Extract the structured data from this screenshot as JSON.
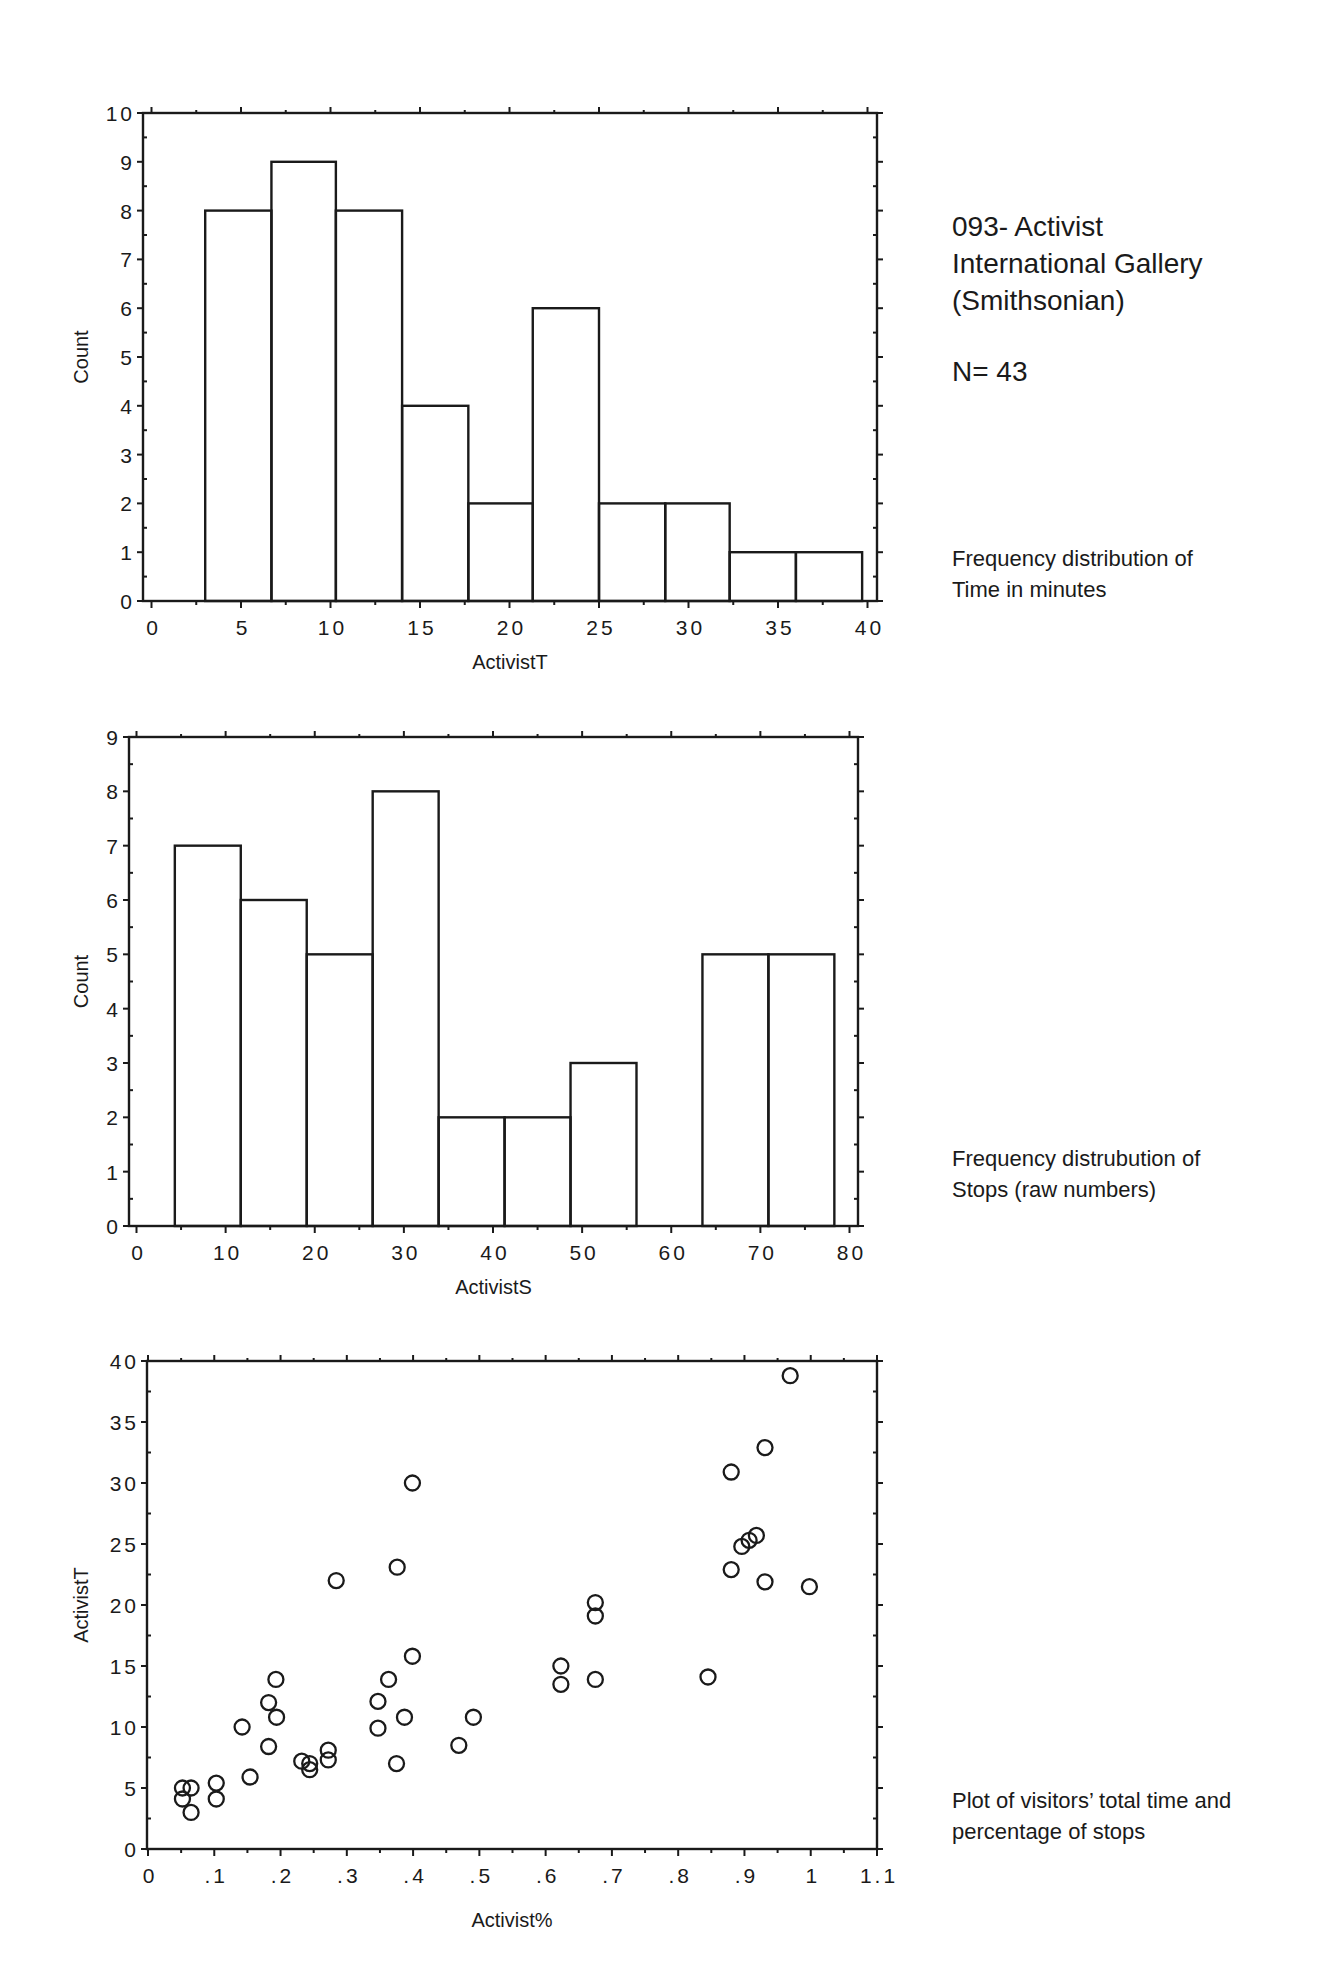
{
  "header": {
    "title_lines": [
      "093- Activist",
      "International Gallery",
      "(Smithsonian)"
    ],
    "n_label": "N= 43"
  },
  "captions": {
    "chart1": [
      "Frequency distribution of",
      "Time in minutes"
    ],
    "chart2": [
      "Frequency distrubution of",
      "Stops (raw numbers)"
    ],
    "chart3": [
      "Plot of visitors’ total time and",
      "percentage of stops"
    ]
  },
  "colors": {
    "ink": "#1a1a1a",
    "background": "#ffffff"
  },
  "chart_data": [
    {
      "type": "bar",
      "subtype": "histogram",
      "title": "Frequency distribution of Time in minutes",
      "xlabel": "ActivistT",
      "ylabel": "Count",
      "xlim": [
        0,
        40
      ],
      "ylim": [
        0,
        10
      ],
      "xticks": [
        0,
        5,
        10,
        15,
        20,
        25,
        30,
        35,
        40
      ],
      "xtick_labels": [
        "0",
        "5",
        "10",
        "15",
        "20",
        "25",
        "30",
        "35",
        "40"
      ],
      "yticks": [
        0,
        1,
        2,
        3,
        4,
        5,
        6,
        7,
        8,
        9,
        10
      ],
      "ytick_labels": [
        "0",
        "1",
        "2",
        "3",
        "4",
        "5",
        "6",
        "7",
        "8",
        "9",
        "10"
      ],
      "grid": false,
      "bin_edges": [
        3.0,
        6.7,
        10.3,
        14.0,
        17.7,
        21.3,
        25.0,
        28.7,
        32.3,
        36.0,
        39.7
      ],
      "values": [
        8,
        9,
        8,
        4,
        2,
        6,
        2,
        2,
        1,
        1
      ]
    },
    {
      "type": "bar",
      "subtype": "histogram",
      "title": "Frequency distrubution of Stops (raw numbers)",
      "xlabel": "ActivistS",
      "ylabel": "Count",
      "xlim": [
        0,
        80
      ],
      "ylim": [
        0,
        9
      ],
      "xticks": [
        0,
        10,
        20,
        30,
        40,
        50,
        60,
        70,
        80
      ],
      "xtick_labels": [
        "0",
        "10",
        "20",
        "30",
        "40",
        "50",
        "60",
        "70",
        "80"
      ],
      "yticks": [
        0,
        1,
        2,
        3,
        4,
        5,
        6,
        7,
        8,
        9
      ],
      "ytick_labels": [
        "0",
        "1",
        "2",
        "3",
        "4",
        "5",
        "6",
        "7",
        "8",
        "9"
      ],
      "grid": false,
      "bin_edges": [
        4.3,
        11.7,
        19.1,
        26.5,
        33.9,
        41.3,
        48.7,
        56.1,
        63.5,
        70.9,
        78.3
      ],
      "values": [
        7,
        6,
        5,
        8,
        2,
        2,
        3,
        0,
        5,
        5
      ]
    },
    {
      "type": "scatter",
      "title": "Plot of visitors’ total time and percentage of stops",
      "xlabel": "Activist%",
      "ylabel": "ActivistT",
      "xlim": [
        0,
        1.1
      ],
      "ylim": [
        0,
        40
      ],
      "xticks": [
        0,
        0.1,
        0.2,
        0.3,
        0.4,
        0.5,
        0.6,
        0.7,
        0.8,
        0.9,
        1.0,
        1.1
      ],
      "xtick_labels": [
        "0",
        ".1",
        ".2",
        ".3",
        ".4",
        ".5",
        ".6",
        ".7",
        ".8",
        ".9",
        "1",
        "1.1"
      ],
      "yticks": [
        0,
        5,
        10,
        15,
        20,
        25,
        30,
        35,
        40
      ],
      "ytick_labels": [
        "0",
        "5",
        "10",
        "15",
        "20",
        "25",
        "30",
        "35",
        "40"
      ],
      "grid": false,
      "marker": "open-circle",
      "points": [
        {
          "x": 0.052,
          "y": 5.0
        },
        {
          "x": 0.065,
          "y": 5.0
        },
        {
          "x": 0.052,
          "y": 4.1
        },
        {
          "x": 0.065,
          "y": 3.0
        },
        {
          "x": 0.103,
          "y": 5.4
        },
        {
          "x": 0.103,
          "y": 4.1
        },
        {
          "x": 0.142,
          "y": 10.0
        },
        {
          "x": 0.154,
          "y": 5.9
        },
        {
          "x": 0.182,
          "y": 12.0
        },
        {
          "x": 0.193,
          "y": 13.9
        },
        {
          "x": 0.194,
          "y": 10.8
        },
        {
          "x": 0.182,
          "y": 8.4
        },
        {
          "x": 0.232,
          "y": 7.2
        },
        {
          "x": 0.244,
          "y": 7.0
        },
        {
          "x": 0.244,
          "y": 6.5
        },
        {
          "x": 0.272,
          "y": 8.1
        },
        {
          "x": 0.272,
          "y": 7.3
        },
        {
          "x": 0.284,
          "y": 22.0
        },
        {
          "x": 0.347,
          "y": 12.1
        },
        {
          "x": 0.347,
          "y": 9.9
        },
        {
          "x": 0.363,
          "y": 13.9
        },
        {
          "x": 0.375,
          "y": 7.0
        },
        {
          "x": 0.376,
          "y": 23.1
        },
        {
          "x": 0.387,
          "y": 10.8
        },
        {
          "x": 0.399,
          "y": 15.8
        },
        {
          "x": 0.399,
          "y": 30.0
        },
        {
          "x": 0.469,
          "y": 8.5
        },
        {
          "x": 0.491,
          "y": 10.8
        },
        {
          "x": 0.623,
          "y": 15.0
        },
        {
          "x": 0.623,
          "y": 13.5
        },
        {
          "x": 0.675,
          "y": 13.9
        },
        {
          "x": 0.675,
          "y": 20.2
        },
        {
          "x": 0.675,
          "y": 19.1
        },
        {
          "x": 0.845,
          "y": 14.1
        },
        {
          "x": 0.88,
          "y": 30.9
        },
        {
          "x": 0.88,
          "y": 22.9
        },
        {
          "x": 0.896,
          "y": 24.8
        },
        {
          "x": 0.907,
          "y": 25.3
        },
        {
          "x": 0.918,
          "y": 25.7
        },
        {
          "x": 0.931,
          "y": 32.9
        },
        {
          "x": 0.931,
          "y": 21.9
        },
        {
          "x": 0.969,
          "y": 38.8
        },
        {
          "x": 0.998,
          "y": 21.5
        }
      ]
    }
  ]
}
